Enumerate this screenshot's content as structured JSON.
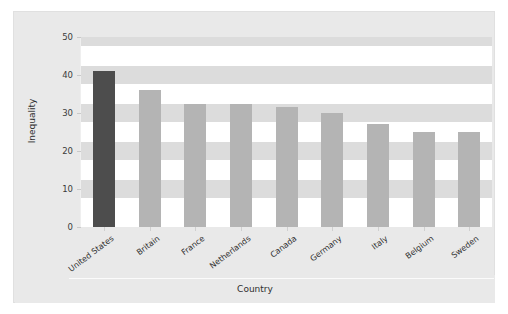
{
  "chart_data": {
    "type": "bar",
    "title": "",
    "xlabel": "Country",
    "ylabel": "Inequality",
    "categories": [
      "United States",
      "Britain",
      "France",
      "Netherlands",
      "Canada",
      "Germany",
      "Italy",
      "Belgium",
      "Sweden"
    ],
    "values": [
      41,
      36,
      32.5,
      32.5,
      31.5,
      30,
      27,
      25,
      25
    ],
    "ylim": [
      0,
      50
    ],
    "yticks": [
      0,
      10,
      20,
      30,
      40,
      50
    ],
    "ytick_labels": [
      "0",
      "10",
      "20",
      "30",
      "40",
      "50"
    ],
    "grid": "horizontal-bands",
    "legend": "none",
    "highlight_index": 0,
    "colors": {
      "bar": "#b4b4b4",
      "bar_highlight": "#4d4d4d",
      "panel_background": "#e9e9e9",
      "plot_background": "#ffffff",
      "band": "#dcdcdc",
      "text": "#2f2f2f",
      "figure_background": "#ffffff"
    }
  }
}
